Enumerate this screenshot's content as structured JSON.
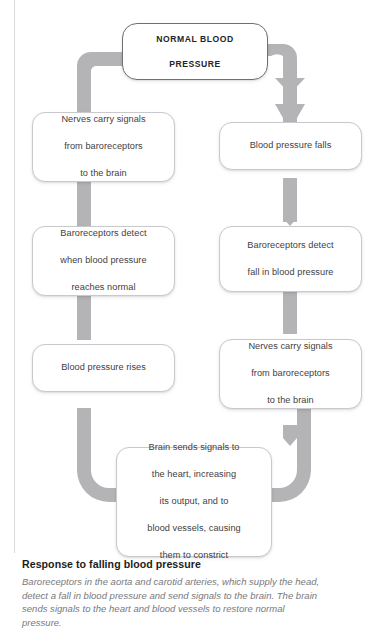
{
  "diagram": {
    "type": "flowchart",
    "title_node": "NORMAL BLOOD\nPRESSURE",
    "arrow_color": "#b4b4b6",
    "box_border_color": "#c9c9cd",
    "head_border_color": "#6f6f76",
    "nodes": [
      {
        "id": "normal",
        "label": "NORMAL BLOOD PRESSURE",
        "line1": "NORMAL BLOOD",
        "line2": "PRESSURE",
        "column": "center"
      },
      {
        "id": "falls",
        "label": "Blood pressure falls",
        "column": "right"
      },
      {
        "id": "baro_fall",
        "label": "Baroreceptors detect fall in blood pressure",
        "line1": "Baroreceptors detect",
        "line2": "fall in blood pressure",
        "column": "right"
      },
      {
        "id": "nerves_right",
        "label": "Nerves carry signals from baroreceptors to the brain",
        "line1": "Nerves carry signals",
        "line2": "from baroreceptors",
        "line3": "to the brain",
        "column": "right"
      },
      {
        "id": "brain",
        "label": "Brain sends signals to the heart, increasing its output, and to blood vessels, causing them to constrict",
        "line1": "Brain sends signals to",
        "line2": "the heart, increasing",
        "line3": "its output, and to",
        "line4": "blood vessels, causing",
        "line5": "them to constrict",
        "column": "center"
      },
      {
        "id": "rises",
        "label": "Blood pressure rises",
        "column": "left"
      },
      {
        "id": "baro_normal",
        "label": "Baroreceptors detect when blood pressure reaches normal",
        "line1": "Baroreceptors detect",
        "line2": "when blood pressure",
        "line3": "reaches normal",
        "column": "left"
      },
      {
        "id": "nerves_left",
        "label": "Nerves carry signals from baroreceptors to the brain",
        "line1": "Nerves carry signals",
        "line2": "from baroreceptors",
        "line3": "to the brain",
        "column": "left"
      }
    ],
    "edges": [
      {
        "from": "normal",
        "to": "falls",
        "direction": "down"
      },
      {
        "from": "falls",
        "to": "baro_fall",
        "direction": "down"
      },
      {
        "from": "baro_fall",
        "to": "nerves_right",
        "direction": "down"
      },
      {
        "from": "nerves_right",
        "to": "brain",
        "direction": "down-left"
      },
      {
        "from": "brain",
        "to": "rises",
        "direction": "up-left"
      },
      {
        "from": "rises",
        "to": "baro_normal",
        "direction": "up"
      },
      {
        "from": "baro_normal",
        "to": "nerves_left",
        "direction": "up"
      },
      {
        "from": "nerves_left",
        "to": "normal",
        "direction": "up-right"
      }
    ]
  },
  "caption": {
    "title": "Response to falling blood pressure",
    "body": "Baroreceptors in the aorta and carotid arteries, which supply the head, detect a fall in blood pressure and send signals to the brain. The brain sends signals to the heart and blood vessels to restore normal pressure."
  }
}
